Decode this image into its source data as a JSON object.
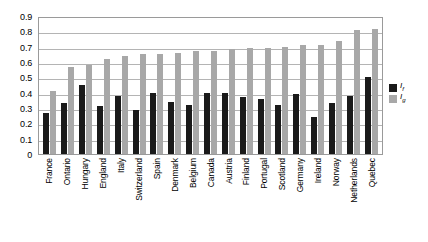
{
  "chart_data": {
    "type": "bar",
    "title": "",
    "subtitle": "",
    "xlabel": "",
    "ylabel": "",
    "ylim": [
      0,
      0.9
    ],
    "ytick_labels": [
      "0.9",
      "0.8",
      "0.7",
      "0.6",
      "0.5",
      "0.4",
      "0.3",
      "0.2",
      "0.1",
      "0"
    ],
    "ytick_values": [
      0.9,
      0.8,
      0.7,
      0.6,
      0.5,
      0.4,
      0.3,
      0.2,
      0.1,
      0
    ],
    "grid": true,
    "grid_axis": "y",
    "legend_position": "right",
    "categories": [
      "France",
      "Ontario",
      "Hungary",
      "England",
      "Italy",
      "Switzerland",
      "Spain",
      "Denmark",
      "Belgium",
      "Canada",
      "Austria",
      "Finland",
      "Portugal",
      "Scotland",
      "Germany",
      "Ireland",
      "Norway",
      "Netherlands",
      "Quebec"
    ],
    "series": [
      {
        "name": "If",
        "label": "I",
        "subscript": "f",
        "color": "#1a1a1a",
        "values": [
          0.27,
          0.33,
          0.45,
          0.31,
          0.38,
          0.29,
          0.4,
          0.34,
          0.32,
          0.4,
          0.4,
          0.37,
          0.36,
          0.32,
          0.39,
          0.24,
          0.33,
          0.38,
          0.5
        ]
      },
      {
        "name": "Ig",
        "label": "I",
        "subscript": "g",
        "color": "#a8a8a8",
        "values": [
          0.41,
          0.57,
          0.58,
          0.62,
          0.64,
          0.65,
          0.65,
          0.66,
          0.67,
          0.675,
          0.685,
          0.69,
          0.69,
          0.7,
          0.71,
          0.71,
          0.735,
          0.81,
          0.815
        ]
      }
    ]
  },
  "legend": {
    "entries": [
      {
        "series": "If",
        "label": "I",
        "subscript": "f"
      },
      {
        "series": "Ig",
        "label": "I",
        "subscript": "g"
      }
    ]
  }
}
